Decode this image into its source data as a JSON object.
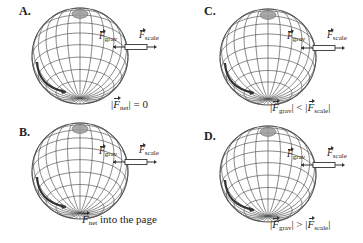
{
  "figure": {
    "panels": [
      {
        "id": "A",
        "label": "A.",
        "force_grav_label": "F",
        "force_grav_sub": "grav",
        "force_scale_label": "F",
        "force_scale_sub": "scale",
        "caption_parts": [
          "|",
          "F",
          "net",
          "| = 0"
        ]
      },
      {
        "id": "B",
        "label": "B.",
        "force_grav_label": "F",
        "force_grav_sub": "grav",
        "force_scale_label": "F",
        "force_scale_sub": "scale",
        "caption_parts": [
          "F",
          "net",
          " into the page"
        ]
      },
      {
        "id": "C",
        "label": "C.",
        "force_grav_label": "F",
        "force_grav_sub": "grav",
        "force_scale_label": "F",
        "force_scale_sub": "scale",
        "caption_parts": [
          "|",
          "F",
          "grav",
          "| < |",
          "F",
          "scale",
          "|"
        ]
      },
      {
        "id": "D",
        "label": "D.",
        "force_grav_label": "F",
        "force_grav_sub": "grav",
        "force_scale_label": "F",
        "force_scale_sub": "scale",
        "caption_parts": [
          "|",
          "F",
          "grav",
          "| > |",
          "F",
          "scale",
          "|"
        ]
      }
    ],
    "colors": {
      "line": "#555555",
      "pole": "#9a9a9a",
      "text": "#222222"
    }
  }
}
